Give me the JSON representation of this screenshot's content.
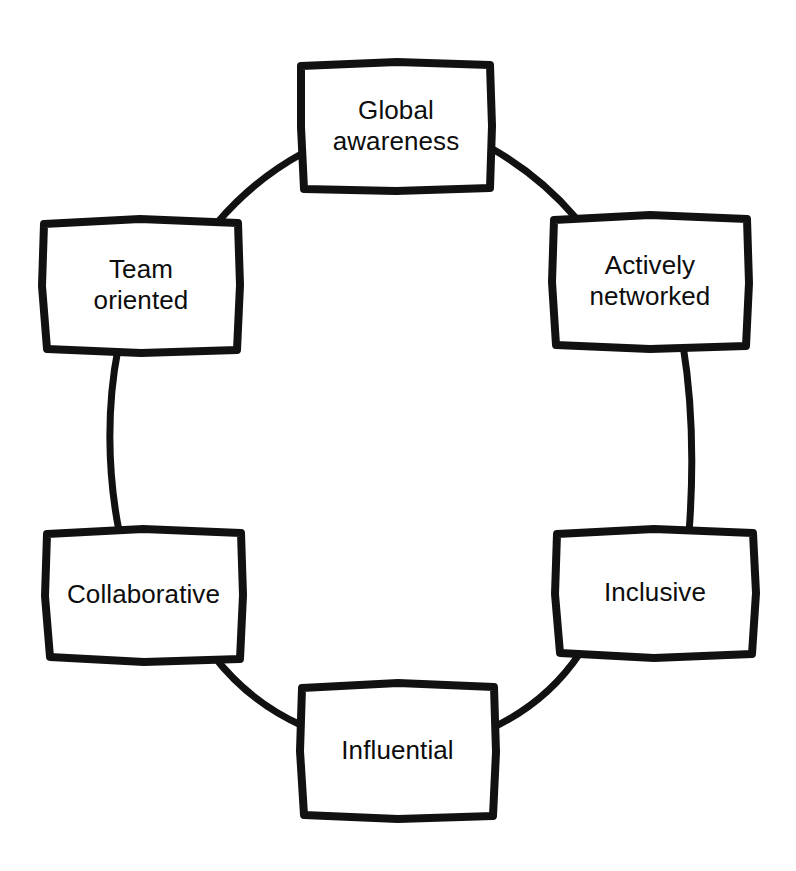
{
  "diagram": {
    "type": "cycle-diagram",
    "style": "hand-drawn marker sketch",
    "stroke_color": "#111111",
    "fill_color": "#ffffff",
    "background_color": "#ffffff",
    "text_color": "#0d0d0d",
    "node_count": 6,
    "nodes": [
      {
        "id": "global-awareness",
        "label": "Global\nawareness",
        "position": "top",
        "x": 300,
        "y": 62,
        "width": 192,
        "height": 128
      },
      {
        "id": "actively-networked",
        "label": "Actively\nnetworked",
        "position": "top-right",
        "x": 552,
        "y": 214,
        "width": 196,
        "height": 134
      },
      {
        "id": "inclusive",
        "label": "Inclusive",
        "position": "bottom-right",
        "x": 555,
        "y": 528,
        "width": 200,
        "height": 128
      },
      {
        "id": "influential",
        "label": "Influential",
        "position": "bottom",
        "x": 300,
        "y": 683,
        "width": 195,
        "height": 135
      },
      {
        "id": "collaborative",
        "label": "Collaborative",
        "position": "bottom-left",
        "x": 45,
        "y": 528,
        "width": 197,
        "height": 132
      },
      {
        "id": "team-oriented",
        "label": "Team\noriented",
        "position": "top-left",
        "x": 42,
        "y": 218,
        "width": 198,
        "height": 134
      }
    ],
    "connectors": [
      {
        "id": "connector-global-to-networked",
        "from": "global-awareness",
        "to": "actively-networked",
        "shape": "arc"
      },
      {
        "id": "connector-networked-to-inclusive",
        "from": "actively-networked",
        "to": "inclusive",
        "shape": "arc"
      },
      {
        "id": "connector-inclusive-to-influential",
        "from": "inclusive",
        "to": "influential",
        "shape": "arc"
      },
      {
        "id": "connector-influential-to-collaborative",
        "from": "influential",
        "to": "collaborative",
        "shape": "arc"
      },
      {
        "id": "connector-collaborative-to-team",
        "from": "collaborative",
        "to": "team-oriented",
        "shape": "arc"
      },
      {
        "id": "connector-team-to-global",
        "from": "team-oriented",
        "to": "global-awareness",
        "shape": "arc"
      }
    ]
  }
}
